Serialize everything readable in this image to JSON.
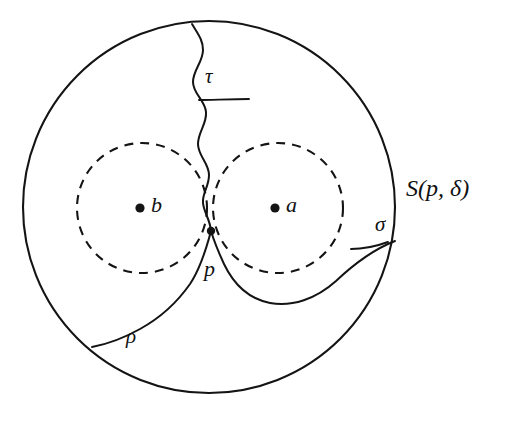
{
  "figure": {
    "kind": "topology-diagram",
    "background_color": "#ffffff",
    "ink_color": "#111111"
  },
  "shapes": {
    "outer_ball": {
      "name": "S(p,delta)",
      "style": "solid",
      "center_x": 209,
      "center_y": 207,
      "radius": 186
    },
    "inner_ball_b": {
      "name": "ball around b",
      "style": "dashed",
      "center_x": 142,
      "center_y": 208,
      "radius": 65
    },
    "inner_ball_a": {
      "name": "ball around a",
      "style": "dashed",
      "center_x": 278,
      "center_y": 208,
      "radius": 65
    }
  },
  "points": [
    {
      "id": "b",
      "label": "b",
      "dot_x": 140,
      "dot_y": 208,
      "label_x": 151,
      "label_y": 197
    },
    {
      "id": "a",
      "label": "a",
      "dot_x": 275,
      "dot_y": 208,
      "label_x": 286,
      "label_y": 197
    },
    {
      "id": "p",
      "label": "p",
      "dot_x": 211,
      "dot_y": 231,
      "label_x": 204,
      "label_y": 262
    }
  ],
  "arcs": [
    {
      "id": "tau",
      "label": "τ",
      "label_x": 205,
      "label_y": 68,
      "leader": true,
      "description": "wavy arc from top of outer circle down to p"
    },
    {
      "id": "sigma",
      "label": "σ",
      "label_x": 375,
      "label_y": 216,
      "leader": true,
      "description": "arc from right of outer circle looping beneath ball a up to p"
    },
    {
      "id": "rho",
      "label": "ρ",
      "label_x": 126,
      "label_y": 330,
      "leader": false,
      "description": "arc from lower-left of outer circle sweeping right up to p"
    }
  ],
  "set_label": {
    "text": "S(p, δ)",
    "x": 406,
    "y": 177
  }
}
